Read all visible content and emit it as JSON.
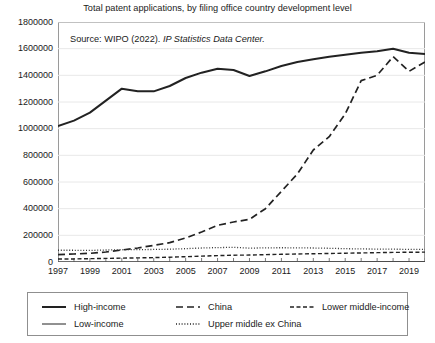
{
  "chart_data": {
    "type": "line",
    "title": "Total patent applications, by filing office country development level",
    "xlabel": "",
    "ylabel": "",
    "xlim": [
      1997,
      2020
    ],
    "ylim": [
      0,
      1800000
    ],
    "ytick_step": 200000,
    "yticks": [
      0,
      200000,
      400000,
      600000,
      800000,
      1000000,
      1200000,
      1400000,
      1600000,
      1800000
    ],
    "ytick_labels": [
      "0",
      "200000",
      "400000",
      "600000",
      "800000",
      "1000000",
      "1200000",
      "1400000",
      "1600000",
      "1800000"
    ],
    "x": [
      1997,
      1998,
      1999,
      2000,
      2001,
      2002,
      2003,
      2004,
      2005,
      2006,
      2007,
      2008,
      2009,
      2010,
      2011,
      2012,
      2013,
      2014,
      2015,
      2016,
      2017,
      2018,
      2019,
      2020
    ],
    "xticks": [
      1997,
      1998,
      1999,
      2000,
      2001,
      2002,
      2003,
      2004,
      2005,
      2006,
      2007,
      2008,
      2009,
      2010,
      2011,
      2012,
      2013,
      2014,
      2015,
      2016,
      2017,
      2018,
      2019,
      2020
    ],
    "xtick_labels": [
      "1997",
      "",
      "1999",
      "",
      "2001",
      "",
      "2003",
      "",
      "2005",
      "",
      "2007",
      "",
      "2009",
      "",
      "2011",
      "",
      "2013",
      "",
      "2015",
      "",
      "2017",
      "",
      "2019",
      ""
    ],
    "grid": "horizontal",
    "legend_position": "below",
    "annotations": [
      {
        "name": "source-note",
        "text_plain": "Source: WIPO (2022). ",
        "text_italic": "IP Statistics Data Center."
      }
    ],
    "series": [
      {
        "name": "High-income",
        "style": "solid-thick",
        "color": "#222222",
        "values": [
          1020000,
          1060000,
          1120000,
          1210000,
          1300000,
          1280000,
          1280000,
          1320000,
          1380000,
          1420000,
          1450000,
          1440000,
          1395000,
          1430000,
          1470000,
          1500000,
          1520000,
          1540000,
          1555000,
          1570000,
          1580000,
          1600000,
          1570000,
          1560000
        ]
      },
      {
        "name": "China",
        "style": "dashed-long",
        "color": "#222222",
        "values": [
          55000,
          60000,
          65000,
          75000,
          90000,
          105000,
          125000,
          145000,
          180000,
          225000,
          275000,
          300000,
          320000,
          400000,
          530000,
          660000,
          840000,
          940000,
          1110000,
          1360000,
          1400000,
          1540000,
          1430000,
          1500000
        ]
      },
      {
        "name": "Lower middle-income",
        "style": "dashed-short",
        "color": "#222222",
        "values": [
          22000,
          23000,
          25000,
          27000,
          29000,
          31000,
          33000,
          36000,
          40000,
          44000,
          48000,
          51000,
          52000,
          55000,
          58000,
          60000,
          62000,
          64000,
          66000,
          68000,
          70000,
          72000,
          73000,
          74000
        ]
      },
      {
        "name": "Low-income",
        "style": "solid-thin",
        "color": "#444444",
        "values": [
          1200,
          1300,
          1400,
          1500,
          1600,
          1700,
          1800,
          1900,
          2000,
          2100,
          2200,
          2300,
          2300,
          2400,
          2500,
          2600,
          2700,
          2800,
          2900,
          3000,
          3100,
          3200,
          3200,
          3300
        ]
      },
      {
        "name": "Upper middle ex China",
        "style": "dotted",
        "color": "#333333",
        "values": [
          88000,
          88000,
          87000,
          90000,
          92000,
          93000,
          94000,
          96000,
          100000,
          105000,
          108000,
          110000,
          104000,
          106000,
          107000,
          106000,
          105000,
          103000,
          100000,
          98000,
          97000,
          96000,
          95000,
          94000
        ]
      }
    ]
  },
  "legend": {
    "entries": [
      {
        "label": "High-income",
        "style": "solid-thick"
      },
      {
        "label": "China",
        "style": "dashed-long"
      },
      {
        "label": "Lower middle-income",
        "style": "dashed-short"
      },
      {
        "label": "Low-income",
        "style": "solid-thin"
      },
      {
        "label": "Upper middle ex China",
        "style": "dotted"
      }
    ]
  }
}
